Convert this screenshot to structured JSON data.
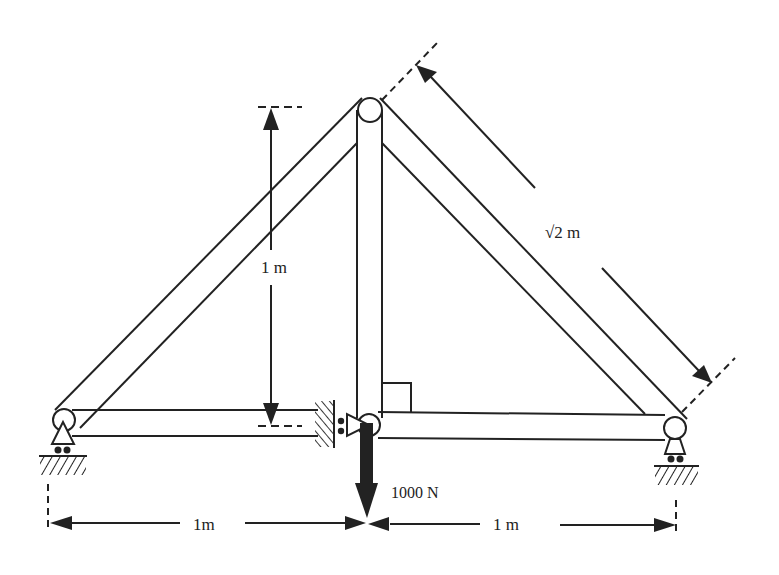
{
  "diagram": {
    "type": "truss",
    "labels": {
      "height": "1 m",
      "diagonal_length": "√2 m",
      "load": "1000 N",
      "left_span": "1m",
      "right_span": "1 m"
    },
    "members": [
      {
        "name": "left-diagonal",
        "from": "left-support-joint",
        "to": "apex-joint"
      },
      {
        "name": "right-diagonal",
        "from": "apex-joint",
        "to": "right-support-joint"
      },
      {
        "name": "vertical",
        "from": "apex-joint",
        "to": "center-bottom-joint"
      },
      {
        "name": "bottom-chord-left",
        "from": "left-support-joint",
        "to": "center-bottom-joint"
      },
      {
        "name": "bottom-chord-right",
        "from": "center-bottom-joint",
        "to": "right-support-joint"
      }
    ],
    "joints": [
      "left-support-joint",
      "apex-joint",
      "center-bottom-joint",
      "right-support-joint"
    ],
    "supports": [
      {
        "joint": "left-support-joint",
        "kind": "roller on ground"
      },
      {
        "joint": "center-bottom-joint",
        "kind": "roller against wall"
      },
      {
        "joint": "right-support-joint",
        "kind": "roller on ground"
      }
    ],
    "load": {
      "joint": "center-bottom-joint",
      "magnitude": "1000 N",
      "direction": "down"
    },
    "colors": {
      "stroke": "#222222",
      "background": "#ffffff"
    }
  }
}
